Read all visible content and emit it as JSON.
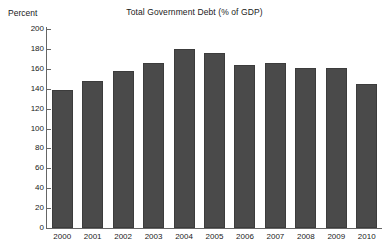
{
  "chart_data": {
    "type": "bar",
    "title": "Total Government Debt (% of GDP)",
    "xlabel": "",
    "ylabel": "Percent",
    "categories": [
      "2000",
      "2001",
      "2002",
      "2003",
      "2004",
      "2005",
      "2006",
      "2007",
      "2008",
      "2009",
      "2010"
    ],
    "values": [
      139,
      148,
      158,
      166,
      180,
      176,
      164,
      166,
      161,
      161,
      145
    ],
    "ylim": [
      0,
      200
    ],
    "ytick_step": 20,
    "yticks": [
      "0",
      "20",
      "40",
      "60",
      "80",
      "100",
      "120",
      "140",
      "160",
      "180",
      "200"
    ],
    "grid": false,
    "legend": null,
    "bar_color": "#4a4a4a",
    "axis_color": "#666666",
    "text_color": "#1a1a1a",
    "background": "#ffffff"
  }
}
